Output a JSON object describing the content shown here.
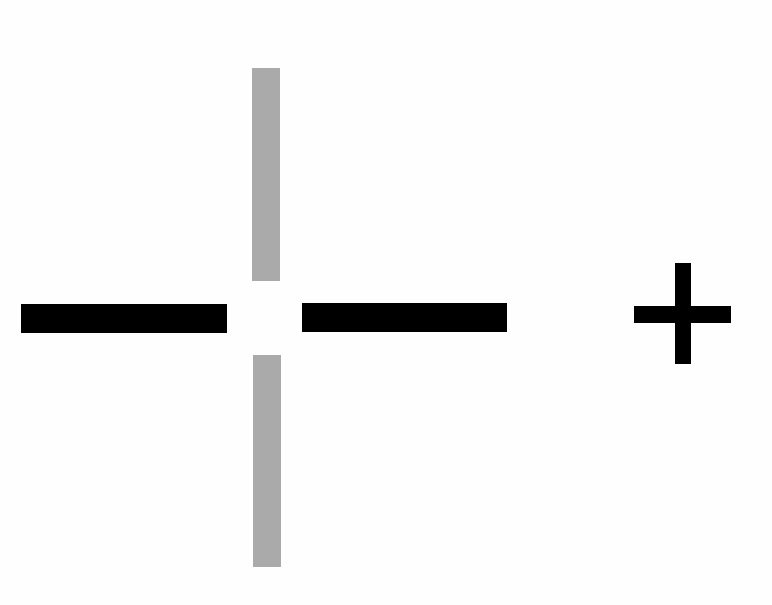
{
  "figure": {
    "colors": {
      "background": "#fefefe",
      "black_bar": "#000000",
      "gray_bar": "#aaaaaa"
    },
    "elements": [
      {
        "name": "left-horizontal-bar",
        "color": "black",
        "x": 21,
        "y": 304,
        "w": 206,
        "h": 29
      },
      {
        "name": "right-horizontal-bar",
        "color": "black",
        "x": 302,
        "y": 303,
        "w": 205,
        "h": 29
      },
      {
        "name": "top-vertical-bar",
        "color": "gray",
        "x": 252,
        "y": 68,
        "w": 28,
        "h": 213
      },
      {
        "name": "bottom-vertical-bar",
        "color": "gray",
        "x": 253,
        "y": 355,
        "w": 28,
        "h": 212
      },
      {
        "name": "plus-vertical-stroke",
        "color": "black",
        "x": 675,
        "y": 263,
        "w": 16,
        "h": 101
      },
      {
        "name": "plus-horizontal-stroke",
        "color": "black",
        "x": 634,
        "y": 306,
        "w": 97,
        "h": 17
      }
    ]
  }
}
